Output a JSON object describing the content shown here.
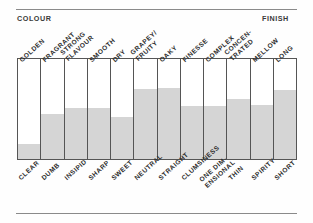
{
  "figure": {
    "header_left": "COLOUR",
    "header_right": "FINISH",
    "accent_fill": "#d5d5d5",
    "frame_color": "#555555",
    "rule_color": "#8a8a8a"
  },
  "chart_data": {
    "type": "bar",
    "title": "",
    "subtitle": "",
    "xlabel": "",
    "ylabel": "",
    "ylim": [
      0,
      100
    ],
    "grid": false,
    "legend": "none",
    "orientation": "vertical",
    "axis_pole_top_label": "COLOUR",
    "axis_pole_bottom_label": "FINISH",
    "top_categories": [
      "GOLDEN",
      "FRAGRANT",
      "STRONG FLAVOUR",
      "SMOOTH",
      "DRY",
      "GRAPEY/ FRUITY",
      "OAKY",
      "FINESSE",
      "COMPLEX",
      "CONCEN- TRATED",
      "MELLOW",
      "LONG"
    ],
    "bottom_categories": [
      "CLEAR",
      "DUMB",
      "INSIPID",
      "SHARP",
      "SWEET",
      "NEUTRAL",
      "STRAIGHT",
      "CLUMSINESS",
      "ONE DIM- ENSIONAL",
      "THIN",
      "SPIRITY",
      "SHORT"
    ],
    "values": [
      15,
      45,
      51,
      51,
      42,
      70,
      71,
      53,
      53,
      60,
      54,
      69
    ],
    "bars": [
      {
        "top_label_l1": "GOLDEN",
        "top_label_l2": "",
        "bottom_label_l1": "CLEAR",
        "bottom_label_l2": "",
        "value": 15
      },
      {
        "top_label_l1": "FRAGRANT",
        "top_label_l2": "",
        "bottom_label_l1": "DUMB",
        "bottom_label_l2": "",
        "value": 45
      },
      {
        "top_label_l1": "STRONG",
        "top_label_l2": "FLAVOUR",
        "bottom_label_l1": "INSIPID",
        "bottom_label_l2": "",
        "value": 51
      },
      {
        "top_label_l1": "SMOOTH",
        "top_label_l2": "",
        "bottom_label_l1": "SHARP",
        "bottom_label_l2": "",
        "value": 51
      },
      {
        "top_label_l1": "DRY",
        "top_label_l2": "",
        "bottom_label_l1": "SWEET",
        "bottom_label_l2": "",
        "value": 42
      },
      {
        "top_label_l1": "GRAPEY/",
        "top_label_l2": "FRUITY",
        "bottom_label_l1": "NEUTRAL",
        "bottom_label_l2": "",
        "value": 70
      },
      {
        "top_label_l1": "OAKY",
        "top_label_l2": "",
        "bottom_label_l1": "STRAIGHT",
        "bottom_label_l2": "",
        "value": 71
      },
      {
        "top_label_l1": "FINESSE",
        "top_label_l2": "",
        "bottom_label_l1": "CLUMSINESS",
        "bottom_label_l2": "",
        "value": 53
      },
      {
        "top_label_l1": "COMPLEX",
        "top_label_l2": "",
        "bottom_label_l1": "ONE DIM-",
        "bottom_label_l2": "ENSIONAL",
        "value": 53
      },
      {
        "top_label_l1": "CONCEN-",
        "top_label_l2": "TRATED",
        "bottom_label_l1": "THIN",
        "bottom_label_l2": "",
        "value": 60
      },
      {
        "top_label_l1": "MELLOW",
        "top_label_l2": "",
        "bottom_label_l1": "SPIRITY",
        "bottom_label_l2": "",
        "value": 54
      },
      {
        "top_label_l1": "LONG",
        "top_label_l2": "",
        "bottom_label_l1": "SHORT",
        "bottom_label_l2": "",
        "value": 69
      }
    ]
  }
}
